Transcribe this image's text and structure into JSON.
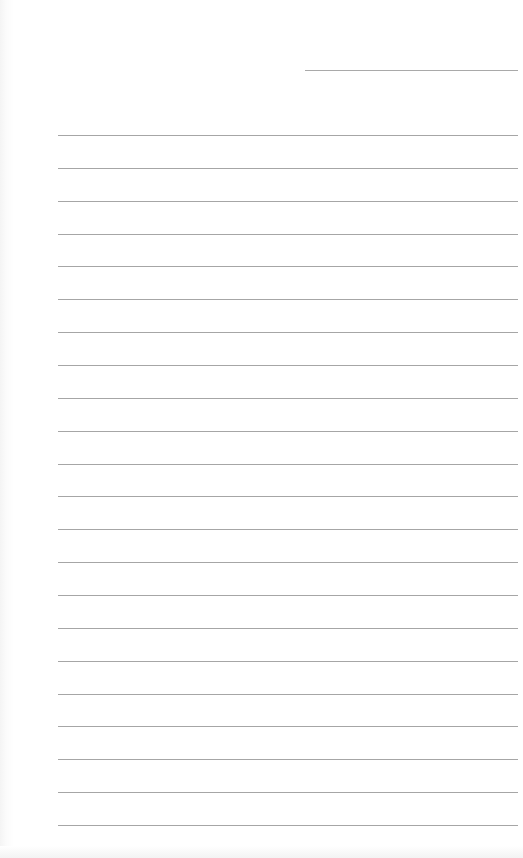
{
  "document": {
    "type": "lined-paper",
    "header_field": {
      "label": "",
      "value": ""
    },
    "ruled_line_count": 22,
    "lines": [
      "",
      "",
      "",
      "",
      "",
      "",
      "",
      "",
      "",
      "",
      "",
      "",
      "",
      "",
      "",
      "",
      "",
      "",
      "",
      "",
      "",
      ""
    ]
  },
  "colors": {
    "paper": "#ffffff",
    "rule": "#a6a6a6"
  }
}
